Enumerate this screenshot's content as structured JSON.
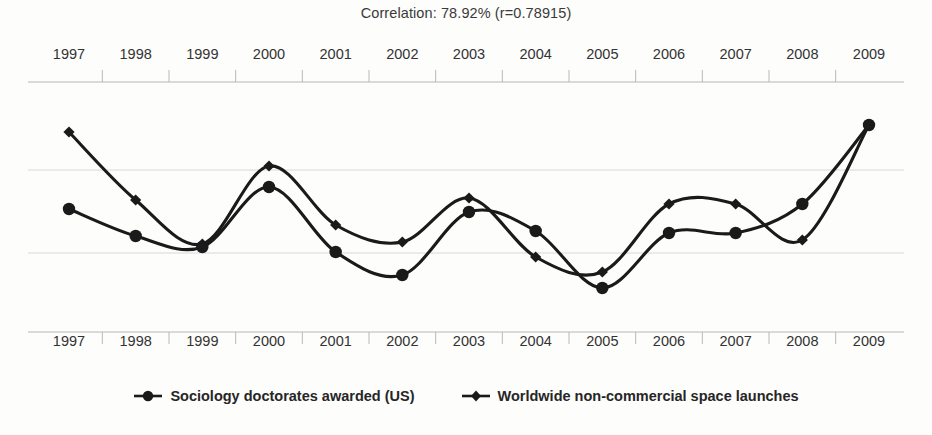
{
  "chart_data": {
    "type": "line",
    "title": "Correlation: 78.92% (r=0.78915)",
    "xlabel": "",
    "ylabel": "",
    "grid": true,
    "legend_position": "bottom",
    "categories": [
      "1997",
      "1998",
      "1999",
      "2000",
      "2001",
      "2002",
      "2003",
      "2004",
      "2005",
      "2006",
      "2007",
      "2008",
      "2009"
    ],
    "x": [
      1997,
      1998,
      1999,
      2000,
      2001,
      2002,
      2003,
      2004,
      2005,
      2006,
      2007,
      2008,
      2009
    ],
    "series": [
      {
        "name": "Sociology doctorates awarded (US)",
        "marker": "circle",
        "color": "#1a1a1a",
        "values": [
          209,
          236,
          247,
          187,
          252,
          275,
          212,
          231,
          288,
          233,
          233,
          204,
          125
        ]
      },
      {
        "name": "Worldwide non-commercial space launches",
        "marker": "diamond",
        "color": "#1a1a1a",
        "values": [
          132,
          200,
          244,
          166,
          225,
          242,
          198,
          257,
          272,
          204,
          204,
          240,
          125
        ]
      }
    ],
    "value_axis_note": "values are screen y-positions; lower number = higher on chart",
    "gridlines_y": [
      82,
      170,
      253,
      332
    ],
    "axis_top_y": 82,
    "axis_bottom_y": 332
  },
  "title": {
    "text": "Correlation: 78.92% (r=0.78915)"
  },
  "axis": {
    "top_years": [
      "1997",
      "1998",
      "1999",
      "2000",
      "2001",
      "2002",
      "2003",
      "2004",
      "2005",
      "2006",
      "2007",
      "2008",
      "2009"
    ],
    "bottom_years": [
      "1997",
      "1998",
      "1999",
      "2000",
      "2001",
      "2002",
      "2003",
      "2004",
      "2005",
      "2006",
      "2007",
      "2008",
      "2009"
    ]
  },
  "legend": {
    "items": [
      {
        "label": "Sociology doctorates awarded (US)",
        "marker": "circle"
      },
      {
        "label": "Worldwide non-commercial space launches",
        "marker": "diamond"
      }
    ]
  },
  "colors": {
    "line": "#1a1a1a",
    "grid": "#d8d8d8",
    "axis": "#b8b8b8",
    "text": "#333333",
    "background": "#fdfdfc"
  }
}
